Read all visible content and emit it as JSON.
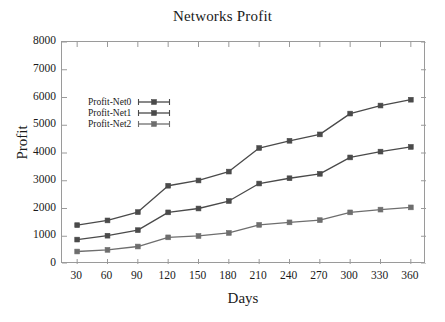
{
  "chart_data": {
    "type": "line",
    "title": "Networks Profit",
    "xlabel": "Days",
    "ylabel": "Profit",
    "x": [
      30,
      60,
      90,
      120,
      150,
      180,
      210,
      240,
      270,
      300,
      330,
      360
    ],
    "xtick_labels": [
      "30",
      "60",
      "90",
      "120",
      "150",
      "180",
      "210",
      "240",
      "270",
      "300",
      "330",
      "360"
    ],
    "ytick_labels": [
      "0",
      "1000",
      "2000",
      "3000",
      "4000",
      "5000",
      "6000",
      "7000",
      "8000"
    ],
    "yticks": [
      0,
      1000,
      2000,
      3000,
      4000,
      5000,
      6000,
      7000,
      8000
    ],
    "xlim": [
      15,
      375
    ],
    "ylim": [
      0,
      8000
    ],
    "grid": false,
    "legend_position": "upper left inside",
    "series": [
      {
        "name": "Profit-Net0",
        "color": "#4a4a4a",
        "marker": "square",
        "values": [
          1400,
          1570,
          1870,
          2820,
          3010,
          3330,
          4180,
          4440,
          4670,
          5420,
          5710,
          5920
        ]
      },
      {
        "name": "Profit-Net1",
        "color": "#4a4a4a",
        "marker": "square",
        "values": [
          880,
          1020,
          1220,
          1860,
          2000,
          2270,
          2900,
          3090,
          3250,
          3840,
          4050,
          4220
        ]
      },
      {
        "name": "Profit-Net2",
        "color": "#6e6e6e",
        "marker": "square",
        "values": [
          450,
          510,
          630,
          960,
          1010,
          1120,
          1410,
          1500,
          1580,
          1860,
          1960,
          2040
        ]
      }
    ]
  },
  "legend": {
    "items": [
      {
        "label": "Profit-Net0"
      },
      {
        "label": "Profit-Net1"
      },
      {
        "label": "Profit-Net2"
      }
    ]
  },
  "colors": {
    "axis": "#9a9a9a",
    "text": "#1a1a1a",
    "background": "#ffffff"
  }
}
